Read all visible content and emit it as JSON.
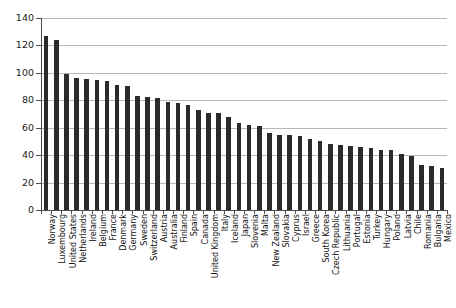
{
  "chart_data": {
    "type": "bar",
    "title": "",
    "subtitle": "",
    "xlabel": "",
    "ylabel": "",
    "ylim": [
      0,
      140
    ],
    "ytick_step": 20,
    "yticks": [
      "0",
      "20",
      "40",
      "60",
      "80",
      "100",
      "120",
      "140"
    ],
    "grid": true,
    "grid_axis": "y",
    "legend": false,
    "legend_position": "none",
    "orientation": "vertical",
    "bar_color": "#2b2b2b",
    "categories": [
      "Norway",
      "Luxembourg",
      "United States",
      "Netherlands",
      "Ireland",
      "Belgium",
      "France",
      "Denmark",
      "Germany",
      "Sweden",
      "Switzerland",
      "Austria",
      "Australia",
      "Finland",
      "Spain",
      "Canada",
      "United Kingdom",
      "Italy",
      "Iceland",
      "Japan",
      "Slovenia",
      "Malta",
      "New Zealand",
      "Slovakia",
      "Cyprus",
      "Israel",
      "Greece",
      "South Korea",
      "Czech Republic",
      "Lithuania",
      "Portugal",
      "Estonia",
      "Turkey",
      "Hungary",
      "Poland",
      "Latvia",
      "Chile",
      "Romania",
      "Bulgaria",
      "Mexico"
    ],
    "values": [
      127,
      124,
      99.5,
      96.5,
      95.5,
      94.5,
      94,
      91,
      90.5,
      83,
      82.5,
      81.5,
      78.5,
      78,
      76.5,
      73,
      71,
      71,
      67.5,
      63.5,
      62,
      61.5,
      56.5,
      55,
      55,
      54,
      52,
      50,
      48.5,
      47.5,
      46.5,
      46,
      45,
      44,
      43.5,
      41,
      39.5,
      33,
      32,
      31
    ]
  }
}
